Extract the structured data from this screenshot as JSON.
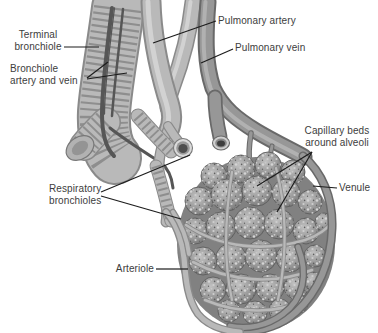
{
  "figure": {
    "type": "anatomical-diagram",
    "background_color": "#ffffff",
    "label_text_color": "#3d3d3d",
    "leader_line_color": "#1c1c1c",
    "artwork_palette": {
      "bronchiole_body": "#c0c0c0",
      "bronchiole_ribs": "#8e8e8e",
      "artery_vessel": "#b9b9b9",
      "vein_vessel": "#979797",
      "alveoli_base": "#818181",
      "capillary_speckle": "#d4d4d4"
    },
    "labels": {
      "terminal_bronchiole": {
        "line1": "Terminal",
        "line2": "bronchiole"
      },
      "bronchiole_artery_vein": {
        "line1": "Bronchiole",
        "line2": "artery and vein"
      },
      "pulmonary_artery": {
        "text": "Pulmonary artery"
      },
      "pulmonary_vein": {
        "text": "Pulmonary vein"
      },
      "capillary_beds": {
        "line1": "Capillary beds",
        "line2": "around alveoli"
      },
      "venule": {
        "text": "Venule"
      },
      "respiratory_bronchioles": {
        "line1": "Respiratory",
        "line2": "bronchioles"
      },
      "arteriole": {
        "text": "Arteriole"
      }
    }
  }
}
